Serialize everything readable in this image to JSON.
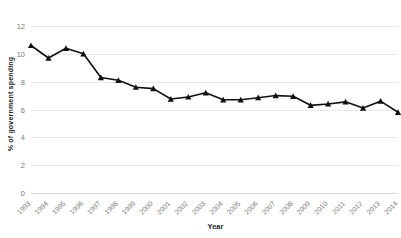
{
  "chart_data": {
    "type": "line",
    "title": "",
    "xlabel": "Year",
    "ylabel": "% of government spending",
    "xlim": [
      1993,
      2014
    ],
    "ylim": [
      0,
      12
    ],
    "ytick_step": 2,
    "yticks": [
      "0",
      "2",
      "4",
      "6",
      "8",
      "10",
      "12"
    ],
    "grid": "horizontal",
    "legend": "none",
    "marker": "triangle",
    "line_color": "#111111",
    "grid_color": "#e9e9e9",
    "categories": [
      "1993",
      "1994",
      "1995",
      "1996",
      "1997",
      "1998",
      "1999",
      "2000",
      "2001",
      "2002",
      "2003",
      "2004",
      "2005",
      "2006",
      "2007",
      "2008",
      "2009",
      "2010",
      "2011",
      "2012",
      "2013",
      "2014"
    ],
    "values": [
      10.6,
      9.7,
      10.4,
      10.0,
      8.3,
      8.1,
      7.6,
      7.5,
      6.75,
      6.9,
      7.2,
      6.7,
      6.7,
      6.85,
      7.0,
      6.95,
      6.3,
      6.4,
      6.55,
      6.1,
      6.6,
      5.8
    ],
    "series": [
      {
        "name": "% of government spending",
        "values": [
          10.6,
          9.7,
          10.4,
          10.0,
          8.3,
          8.1,
          7.6,
          7.5,
          6.75,
          6.9,
          7.2,
          6.7,
          6.7,
          6.85,
          7.0,
          6.95,
          6.3,
          6.4,
          6.55,
          6.1,
          6.6,
          5.8
        ]
      }
    ]
  },
  "axes": {
    "y_title": "% of government spending",
    "x_title": "Year"
  }
}
